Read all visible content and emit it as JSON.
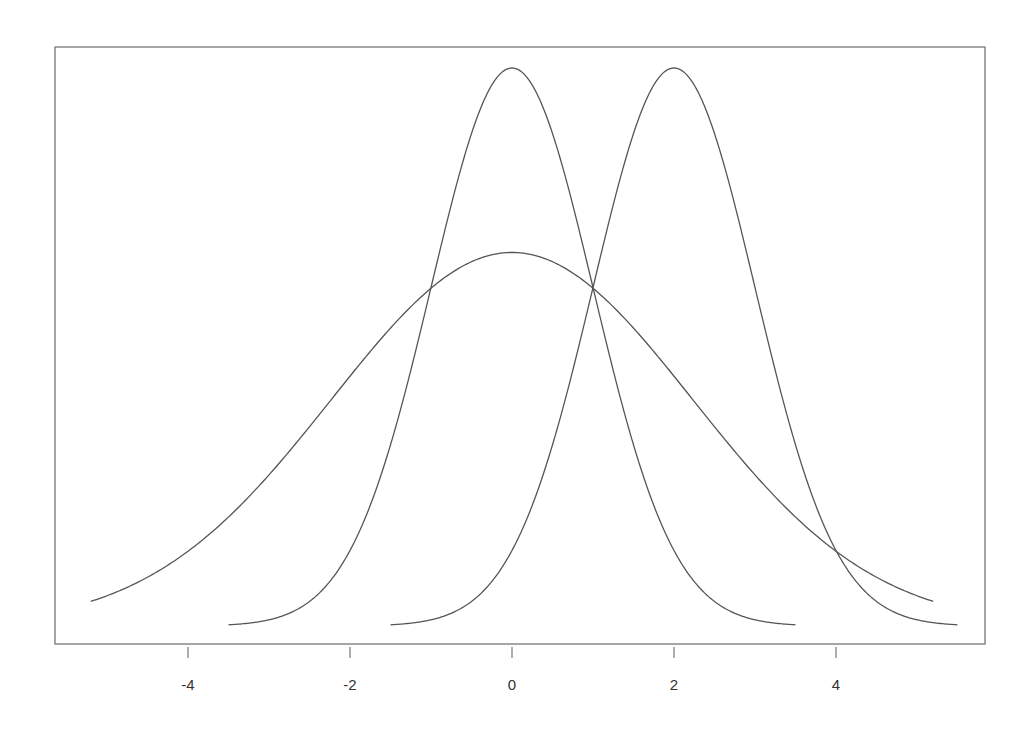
{
  "chart_data": {
    "type": "line",
    "title": "",
    "xlabel": "",
    "ylabel": "",
    "xlim": [
      -5.5,
      5.8
    ],
    "grid": false,
    "legend": null,
    "x_ticks": [
      -4,
      -2,
      0,
      2,
      4
    ],
    "x_tick_labels": [
      "-4",
      "-2",
      "0",
      "2",
      "4"
    ],
    "y_ticks": [],
    "series": [
      {
        "name": "wide curve centered at 0",
        "kind": "gaussian",
        "mean": 0,
        "sd": 2.23,
        "peak_density": 0.267,
        "x_range": [
          -5.2,
          5.2
        ]
      },
      {
        "name": "normal(0,1)",
        "kind": "gaussian",
        "mean": 0,
        "sd": 1,
        "peak_density": 0.3989,
        "x_range": [
          -3.5,
          3.5
        ]
      },
      {
        "name": "normal(2,1)",
        "kind": "gaussian",
        "mean": 2,
        "sd": 1,
        "peak_density": 0.3989,
        "x_range": [
          -1.5,
          5.5
        ]
      }
    ],
    "line_color": "#555555",
    "frame_color": "#777777"
  }
}
